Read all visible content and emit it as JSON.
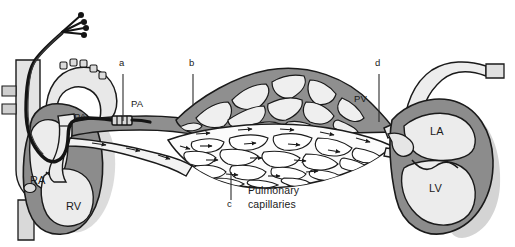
{
  "figure": {
    "background_color": "#ffffff",
    "width": 515,
    "height": 247
  },
  "palette": {
    "outline": "#1a1a1a",
    "myocardium_gray": "#8c8c8c",
    "chamber_light": "#ececec",
    "vessel_dark_gray": "#8f8f8f",
    "vessel_light": "#f2f2f2",
    "catheter_black": "#141414",
    "text": "#1a1a1a",
    "leader_line": "#2b2b2b",
    "shadow_gray": "#c9c9c9"
  },
  "labels": {
    "chambers": [
      {
        "id": "ra",
        "text": "RA",
        "x": 37,
        "y": 181
      },
      {
        "id": "rv",
        "text": "RV",
        "x": 73,
        "y": 207
      },
      {
        "id": "la",
        "text": "LA",
        "x": 437,
        "y": 132
      },
      {
        "id": "lv",
        "text": "LV",
        "x": 436,
        "y": 189
      }
    ],
    "vessels": [
      {
        "id": "pa-proximal",
        "text": "PA",
        "x": 80,
        "y": 118
      },
      {
        "id": "pa-distal",
        "text": "PA",
        "x": 137,
        "y": 105
      },
      {
        "id": "pv",
        "text": "PV",
        "x": 360,
        "y": 100
      }
    ],
    "markers": [
      {
        "id": "marker-a",
        "text": "a",
        "x": 120,
        "y": 64
      },
      {
        "id": "marker-b",
        "text": "b",
        "x": 190,
        "y": 64
      },
      {
        "id": "marker-c",
        "text": "c",
        "x": 228,
        "y": 205
      },
      {
        "id": "marker-d",
        "text": "d",
        "x": 376,
        "y": 64
      }
    ],
    "captions": [
      {
        "id": "pulmonary-capillaries",
        "line1": "Pulmonary",
        "line2": "capillaries",
        "x": 248,
        "y": 190
      }
    ]
  },
  "leader_lines": [
    {
      "id": "leader-a",
      "from_marker": "a",
      "x": 123,
      "y1": 74,
      "y2": 121
    },
    {
      "id": "leader-b",
      "from_marker": "b",
      "x": 193,
      "y1": 74,
      "y2": 106
    },
    {
      "id": "leader-c",
      "from_marker": "c",
      "x": 231,
      "y1": 172,
      "y2": 200
    },
    {
      "id": "leader-d",
      "from_marker": "d",
      "x": 379,
      "y1": 74,
      "y2": 122
    }
  ],
  "structures": {
    "catheter": {
      "name": "pulmonary-artery-catheter",
      "connector_count": 4,
      "balloon_marker": "a"
    },
    "capillary_bed": {
      "name": "pulmonary-capillary-network",
      "arterial_mesh_marker": "b",
      "capillary_marker": "c",
      "venous_outlet_marker": "d"
    }
  }
}
